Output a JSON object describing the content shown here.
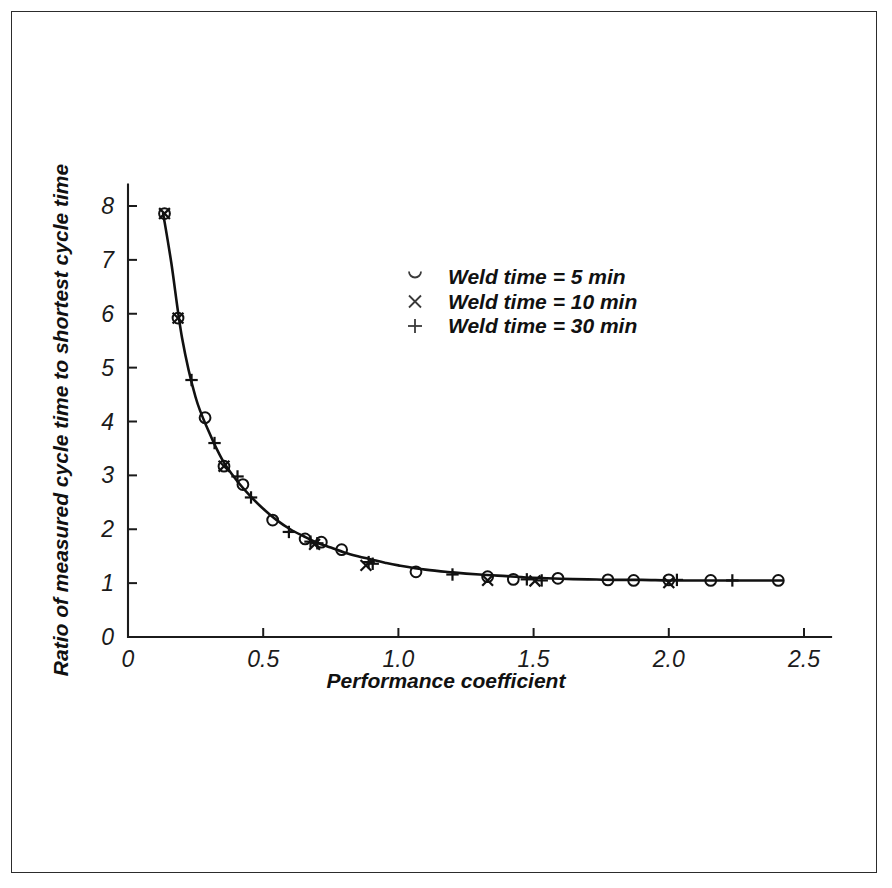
{
  "figure": {
    "background_color": "#ffffff",
    "border_color": "#2c2c2c",
    "ink_color": "#111111"
  },
  "chart_data": {
    "type": "scatter",
    "title": "",
    "subtitle": "",
    "xlabel": "Performance coefficient",
    "ylabel": "Ratio of measured cycle time to shortest cycle time",
    "xlim": [
      0,
      2.6
    ],
    "ylim": [
      0,
      8.4
    ],
    "xticks": [
      0,
      0.5,
      1.0,
      1.5,
      2.0,
      2.5
    ],
    "xticklabels": [
      "0",
      "0.5",
      "1.0",
      "1.5",
      "2.0",
      "2.5"
    ],
    "yticks": [
      0,
      1,
      2,
      3,
      4,
      5,
      6,
      7,
      8
    ],
    "yticklabels": [
      "0",
      "1",
      "2",
      "3",
      "4",
      "5",
      "6",
      "7",
      "8"
    ],
    "grid": false,
    "legend_position": "upper-center",
    "fit_curve": {
      "name": "fitted curve",
      "description": "Smooth monotonically decreasing curve approaching an asymptote near 1.0",
      "x": [
        0.13,
        0.16,
        0.2,
        0.25,
        0.3,
        0.35,
        0.4,
        0.45,
        0.5,
        0.55,
        0.6,
        0.65,
        0.7,
        0.75,
        0.8,
        0.85,
        0.9,
        0.95,
        1.0,
        1.1,
        1.2,
        1.3,
        1.4,
        1.5,
        1.6,
        1.7,
        1.8,
        1.9,
        2.0,
        2.1,
        2.2,
        2.3,
        2.42
      ],
      "y": [
        7.86,
        6.95,
        5.55,
        4.45,
        3.8,
        3.28,
        2.92,
        2.63,
        2.38,
        2.17,
        2.0,
        1.87,
        1.75,
        1.66,
        1.57,
        1.5,
        1.44,
        1.38,
        1.33,
        1.25,
        1.2,
        1.16,
        1.13,
        1.1,
        1.08,
        1.07,
        1.06,
        1.06,
        1.05,
        1.05,
        1.05,
        1.05,
        1.05
      ]
    },
    "series": [
      {
        "name": "Weld time = 5 min",
        "marker": "circle",
        "points": [
          {
            "x": 0.135,
            "y": 7.86
          },
          {
            "x": 0.185,
            "y": 5.92
          },
          {
            "x": 0.285,
            "y": 4.07
          },
          {
            "x": 0.355,
            "y": 3.17
          },
          {
            "x": 0.425,
            "y": 2.83
          },
          {
            "x": 0.535,
            "y": 2.17
          },
          {
            "x": 0.655,
            "y": 1.82
          },
          {
            "x": 0.715,
            "y": 1.76
          },
          {
            "x": 0.79,
            "y": 1.62
          },
          {
            "x": 1.065,
            "y": 1.21
          },
          {
            "x": 1.33,
            "y": 1.12
          },
          {
            "x": 1.425,
            "y": 1.07
          },
          {
            "x": 1.59,
            "y": 1.09
          },
          {
            "x": 1.775,
            "y": 1.06
          },
          {
            "x": 1.87,
            "y": 1.05
          },
          {
            "x": 2.0,
            "y": 1.06
          },
          {
            "x": 2.155,
            "y": 1.05
          },
          {
            "x": 2.405,
            "y": 1.05
          }
        ]
      },
      {
        "name": "Weld time = 10 min",
        "marker": "cross",
        "points": [
          {
            "x": 0.135,
            "y": 7.86
          },
          {
            "x": 0.185,
            "y": 5.92
          },
          {
            "x": 0.355,
            "y": 3.17
          },
          {
            "x": 0.69,
            "y": 1.72
          },
          {
            "x": 0.88,
            "y": 1.33
          },
          {
            "x": 1.33,
            "y": 1.05
          },
          {
            "x": 1.505,
            "y": 1.04
          },
          {
            "x": 2.0,
            "y": 1.01
          }
        ]
      },
      {
        "name": "Weld time = 30 min",
        "marker": "plus",
        "points": [
          {
            "x": 0.235,
            "y": 4.77
          },
          {
            "x": 0.32,
            "y": 3.6
          },
          {
            "x": 0.405,
            "y": 2.98
          },
          {
            "x": 0.455,
            "y": 2.59
          },
          {
            "x": 0.595,
            "y": 1.95
          },
          {
            "x": 0.675,
            "y": 1.77
          },
          {
            "x": 0.7,
            "y": 1.74
          },
          {
            "x": 0.89,
            "y": 1.39
          },
          {
            "x": 0.905,
            "y": 1.36
          },
          {
            "x": 1.2,
            "y": 1.16
          },
          {
            "x": 1.475,
            "y": 1.07
          },
          {
            "x": 1.53,
            "y": 1.05
          },
          {
            "x": 2.03,
            "y": 1.06
          },
          {
            "x": 2.235,
            "y": 1.05
          }
        ]
      }
    ]
  },
  "legend": {
    "entries": [
      {
        "marker": "circle",
        "label": "Weld time = 5 min"
      },
      {
        "marker": "cross",
        "label": "Weld time = 10 min"
      },
      {
        "marker": "plus",
        "label": "Weld time = 30 min"
      }
    ]
  }
}
